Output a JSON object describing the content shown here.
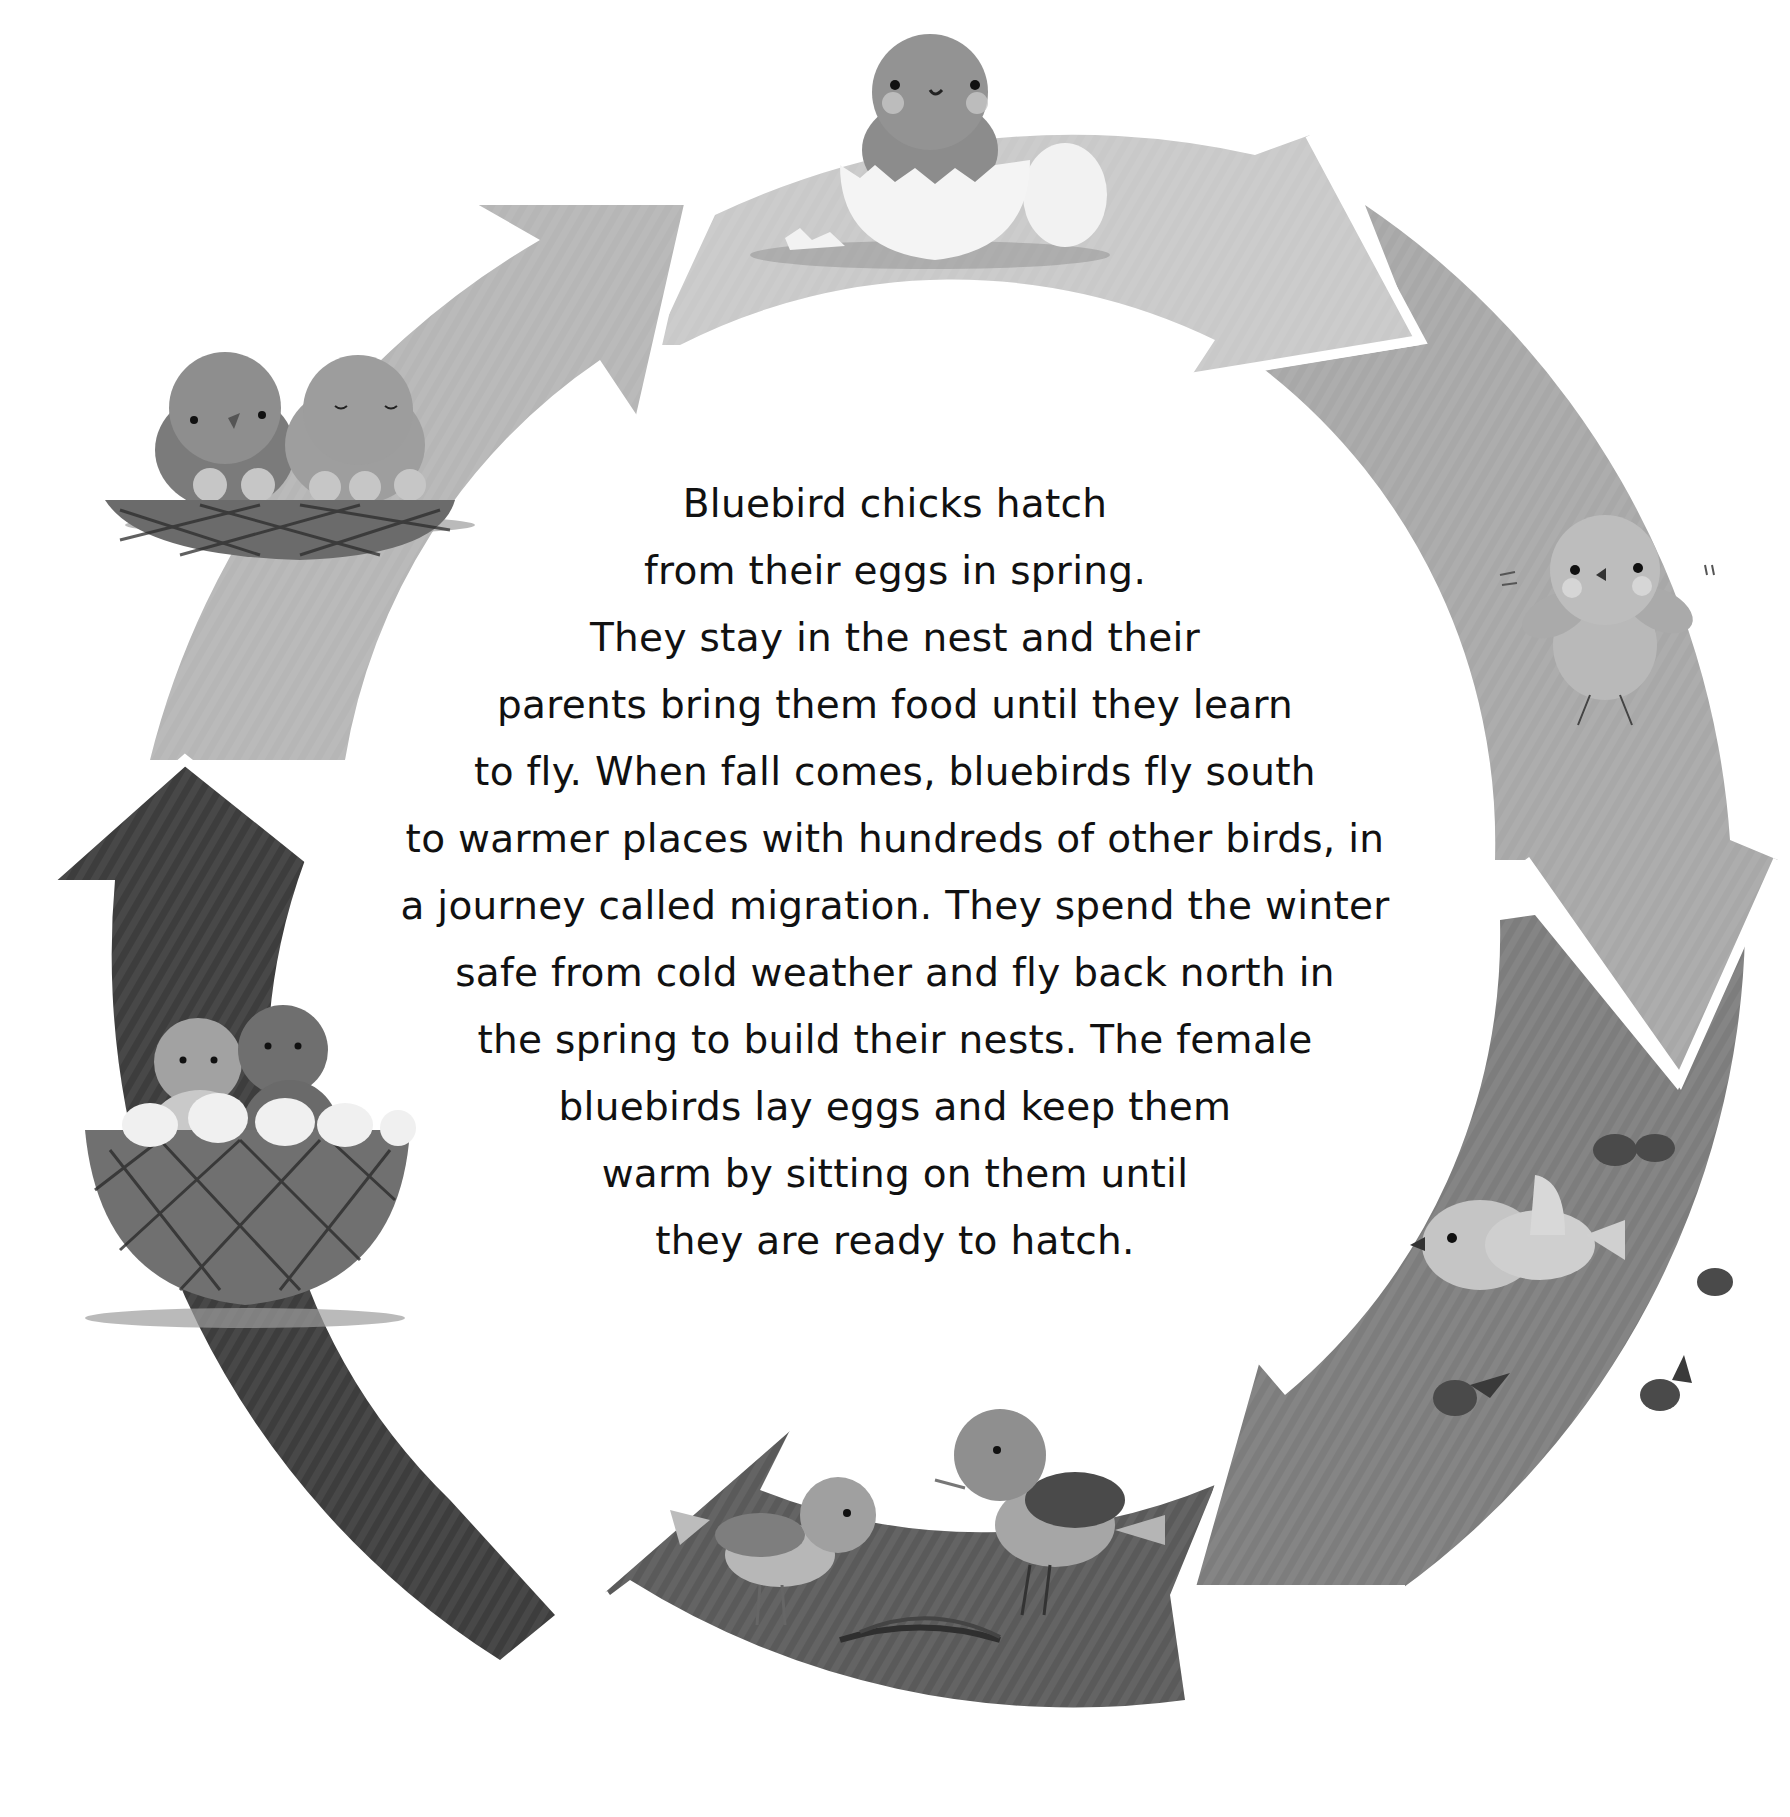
{
  "body_text": {
    "lines": [
      "Bluebird chicks hatch",
      "from their eggs in spring.",
      "They stay in the nest and their",
      "parents bring them food until they learn",
      "to fly. When fall comes, bluebirds fly south",
      "to warmer places with hundreds of other birds, in",
      "a journey called migration. They spend the winter",
      "safe from cold weather and fly back north in",
      "the spring to build their nests. The female",
      "bluebirds lay eggs and keep them",
      "warm by sitting on them until",
      "they are ready to hatch."
    ]
  },
  "cycle": {
    "center": [
      895,
      908
    ],
    "outer_radius": 835,
    "inner_radius": 600,
    "stages": [
      {
        "id": "hatching",
        "label": "Chick hatching from egg",
        "color": "#c9c9c9",
        "illustration": "chick-in-eggshell"
      },
      {
        "id": "fledgling",
        "label": "Chick learning to fly",
        "color": "#a8a8a8",
        "illustration": "flapping-chick"
      },
      {
        "id": "migration",
        "label": "Migration south",
        "color": "#7d7d7d",
        "illustration": "flock-of-flying-birds"
      },
      {
        "id": "nest-building",
        "label": "Building nests in spring",
        "color": "#5a5a5a",
        "illustration": "two-birds-with-twigs"
      },
      {
        "id": "laying-eggs",
        "label": "Female lays and warms eggs",
        "color": "#3d3d3d",
        "illustration": "birds-in-nest-with-eggs"
      },
      {
        "id": "feeding-chicks",
        "label": "Parents feed chicks in nest",
        "color": "#b6b6b6",
        "illustration": "parents-with-chicks-in-nest"
      }
    ]
  },
  "colors": {
    "background": "#ffffff",
    "text": "#111111",
    "arrow_gap": "#ffffff"
  }
}
